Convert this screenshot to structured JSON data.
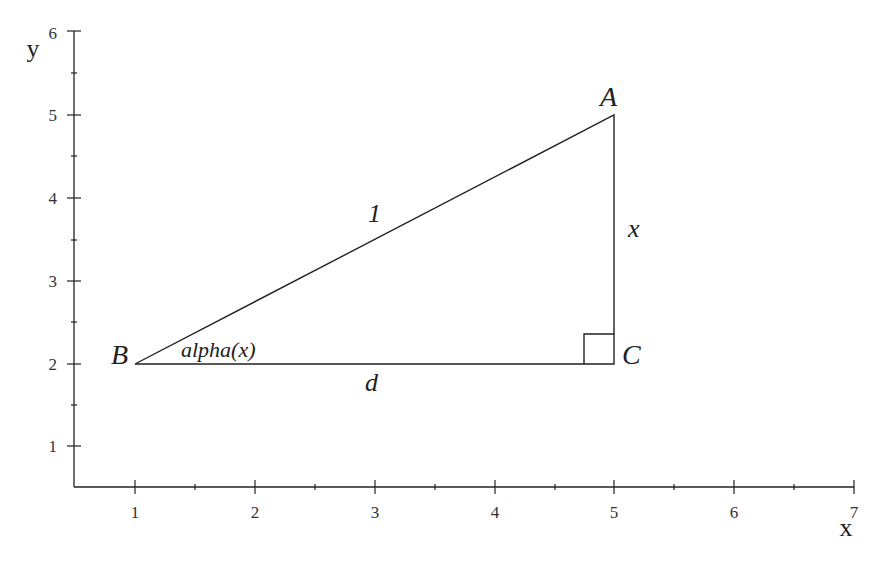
{
  "diagram": {
    "x_axis": {
      "label": "x",
      "range": [
        0.5,
        7
      ],
      "ticks": [
        "1",
        "2",
        "3",
        "4",
        "5",
        "6",
        "7"
      ]
    },
    "y_axis": {
      "label": "y",
      "range": [
        0.5,
        6
      ],
      "ticks": [
        "1",
        "2",
        "3",
        "4",
        "5",
        "6"
      ]
    },
    "vertices": {
      "A": {
        "label": "A",
        "x": 5,
        "y": 5
      },
      "B": {
        "label": "B",
        "x": 1,
        "y": 2
      },
      "C": {
        "label": "C",
        "x": 5,
        "y": 2
      }
    },
    "edges": {
      "hypotenuse": "1",
      "vertical": "x",
      "horizontal": "d"
    },
    "angle_label": "alpha(x)",
    "right_angle_at": "C"
  }
}
